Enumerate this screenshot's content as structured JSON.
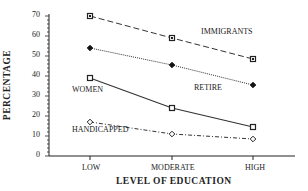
{
  "chart_data": {
    "type": "line",
    "title": "",
    "xlabel": "LEVEL OF EDUCATION",
    "ylabel": "PERCENTAGE",
    "categories": [
      "LOW",
      "MODERATE",
      "HIGH"
    ],
    "ylim": [
      0,
      70
    ],
    "yticks": [
      0,
      10,
      20,
      30,
      40,
      50,
      60,
      70
    ],
    "grid": false,
    "legend": "inline labels",
    "series": [
      {
        "name": "IMMIGRANTS",
        "values": [
          70,
          59,
          48.5
        ],
        "style": "dashed",
        "marker": "square-dot"
      },
      {
        "name": "RETIRE",
        "values": [
          54,
          45.5,
          35.5
        ],
        "style": "dotted",
        "marker": "filled-diamond"
      },
      {
        "name": "WOMEN",
        "values": [
          39,
          24,
          14.5
        ],
        "style": "solid",
        "marker": "open-square"
      },
      {
        "name": "HANDICAPPED",
        "values": [
          17,
          11,
          8.5
        ],
        "style": "dash-dot",
        "marker": "open-diamond"
      }
    ],
    "annotations": [
      {
        "text": "IMMIGRANTS",
        "x": 201,
        "y": 31
      },
      {
        "text": "RETIRE",
        "x": 195,
        "y": 85
      },
      {
        "text": "WOMEN",
        "x": 72,
        "y": 89
      },
      {
        "text": "HANDICAPPED",
        "x": 72,
        "y": 129
      }
    ]
  },
  "labels": {
    "xlabel": "LEVEL OF EDUCATION",
    "ylabel": "PERCENTAGE",
    "immigrants": "IMMIGRANTS",
    "retire": "RETIRE",
    "women": "WOMEN",
    "handicapped": "HANDICAPPED",
    "x_low": "LOW",
    "x_moderate": "MODERATE",
    "x_high": "HIGH",
    "y_ticks": [
      "0",
      "10",
      "20",
      "30",
      "40",
      "50",
      "60",
      "70"
    ]
  }
}
